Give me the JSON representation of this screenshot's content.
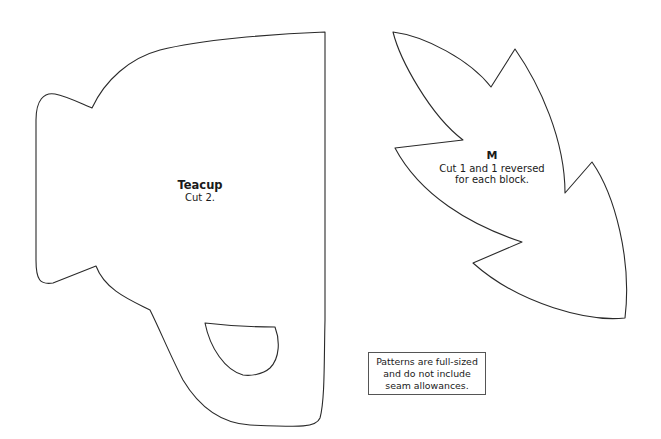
{
  "document": {
    "type": "quilt pattern templates",
    "pieces": [
      {
        "id": "teacup",
        "title": "Teacup",
        "instruction": "Cut 2."
      },
      {
        "id": "M",
        "title": "M",
        "instruction_lines": [
          "Cut 1 and 1 reversed",
          "for each block."
        ]
      }
    ],
    "note": {
      "lines": [
        "Patterns are full-sized",
        "and do not include",
        "seam allowances."
      ]
    },
    "colors": {
      "background": "#ffffff",
      "outline": "#2a2a2a",
      "text": "#1a1a1a"
    }
  }
}
